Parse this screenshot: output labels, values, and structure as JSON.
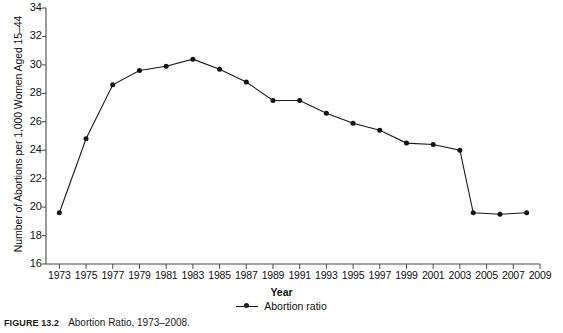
{
  "figure": {
    "caption_label": "FIGURE 13.2",
    "caption_text": "Abortion Ratio, 1973–2008."
  },
  "chart_data": {
    "type": "line",
    "title": "",
    "xlabel": "Year",
    "ylabel": "Number of Abortions per 1,000 Women Aged 15–44",
    "xlim": [
      1972,
      2009
    ],
    "ylim": [
      16,
      34
    ],
    "ytick_labels": [
      "34",
      "32",
      "30",
      "28",
      "26",
      "24",
      "22",
      "20",
      "18",
      "16"
    ],
    "yticks": [
      34,
      32,
      30,
      28,
      26,
      24,
      22,
      20,
      18,
      16
    ],
    "xtick_labels": [
      "1973",
      "1975",
      "1977",
      "1979",
      "1981",
      "1983",
      "1985",
      "1987",
      "1989",
      "1991",
      "1993",
      "1995",
      "1997",
      "1999",
      "2001",
      "2003",
      "2005",
      "2007",
      "2009"
    ],
    "xticks": [
      1973,
      1975,
      1977,
      1979,
      1981,
      1983,
      1985,
      1987,
      1989,
      1991,
      1993,
      1995,
      1997,
      1999,
      2001,
      2003,
      2005,
      2007,
      2009
    ],
    "grid": false,
    "legend_position": "bottom-center",
    "series": [
      {
        "name": "Abortion ratio",
        "marker": "filled-circle",
        "color": "#111111",
        "x": [
          1973,
          1975,
          1977,
          1979,
          1981,
          1983,
          1985,
          1987,
          1989,
          1991,
          1993,
          1995,
          1997,
          1999,
          2001,
          2003,
          2004,
          2006,
          2008
        ],
        "values": [
          19.6,
          24.8,
          28.6,
          29.6,
          29.9,
          30.4,
          29.7,
          28.8,
          27.5,
          27.5,
          26.6,
          25.9,
          25.4,
          24.5,
          24.4,
          24.0,
          19.6,
          19.5,
          19.6
        ]
      }
    ]
  },
  "legend": {
    "entries": [
      {
        "label": "Abortion ratio"
      }
    ]
  }
}
